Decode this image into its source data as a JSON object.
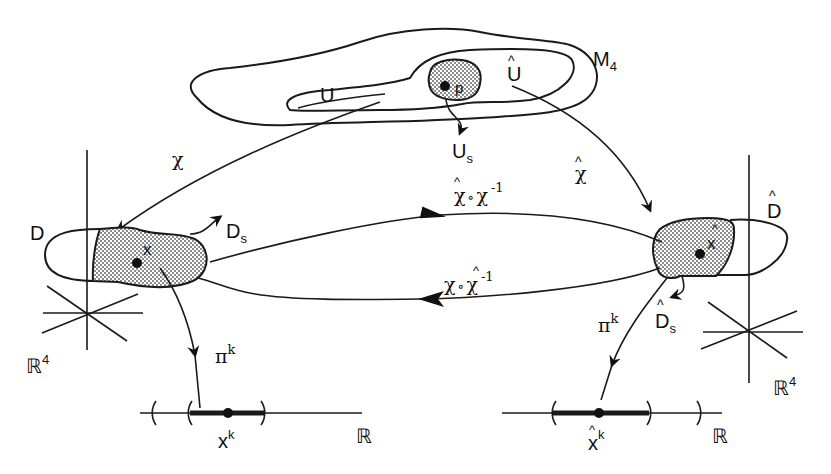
{
  "diagram": {
    "manifold": {
      "label": "M",
      "subscript": "4"
    },
    "chart_domains": {
      "U": {
        "label": "U"
      },
      "U_hat": {
        "label": "Û",
        "base": "U",
        "hat": "^"
      },
      "U_s": {
        "label": "U",
        "subscript": "s"
      },
      "point": {
        "label": "p"
      }
    },
    "maps": {
      "chi": {
        "label": "χ"
      },
      "chi_hat": {
        "label": "χ",
        "hat": "^"
      },
      "forward_transition": {
        "label": "χ̂∘χ",
        "base_left": "χ",
        "op": "∘",
        "base_right": "χ",
        "exponent": "-1",
        "hat_on": "left"
      },
      "backward_transition": {
        "label": "χ∘χ̂",
        "base_left": "χ",
        "op": "∘",
        "base_right": "χ",
        "exponent": "-1",
        "hat_on": "right"
      },
      "projection_left": {
        "label": "π",
        "superscript": "k"
      },
      "projection_right": {
        "label": "π",
        "superscript": "k"
      }
    },
    "left_chart": {
      "domain_label": "D",
      "subdomain": {
        "label": "D",
        "subscript": "s"
      },
      "point_label": "x",
      "space": {
        "label": "ℝ",
        "superscript": "4"
      }
    },
    "right_chart": {
      "domain_label": "D",
      "domain_hat": "^",
      "subdomain": {
        "label": "D",
        "subscript": "s",
        "hat": "^"
      },
      "point_label": "x",
      "point_hat": "^",
      "space": {
        "label": "ℝ",
        "superscript": "4"
      }
    },
    "left_line": {
      "space_label": "ℝ",
      "point": {
        "label": "x",
        "superscript": "k"
      }
    },
    "right_line": {
      "space_label": "ℝ",
      "point": {
        "label": "x",
        "superscript": "k",
        "hat": "^"
      }
    }
  },
  "background_text": [
    "re tine rsation of a map to the tangent of p...",
    "a smooth curve p-(t) passing through p at t ...",
    "ct to M. Map through  to M; Map  to the image (p)",
    "from  M, and ture of p  into M,",
    "which is the image of the curve in it, and",
    "Let U contain M inside the chart with the variation",
    "distance along with the curve. ",
    "for the curve x. Alt. of M x at ...",
    "The chart map is then the image of ...",
    "coordinates are then ... as ..."
  ]
}
